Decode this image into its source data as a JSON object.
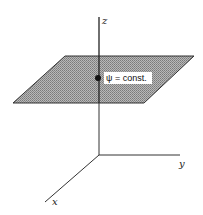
{
  "diagram": {
    "type": "3d-coordinate-plane",
    "axes": {
      "z_label": "z",
      "y_label": "y",
      "x_label": "x"
    },
    "plane": {
      "label": "ψ = const.",
      "fill_color": "#9a9a9a",
      "edge_color": "#333333"
    },
    "point": {
      "color": "#111111"
    }
  }
}
